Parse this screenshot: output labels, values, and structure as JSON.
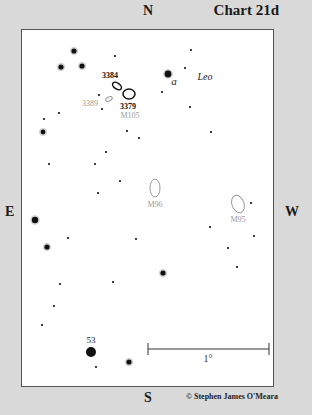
{
  "header": {
    "chart_title": "Chart 21d"
  },
  "compass": {
    "north": "N",
    "south": "S",
    "east": "E",
    "west": "W"
  },
  "constellation": {
    "label": "Leo",
    "x": 205,
    "y": 80
  },
  "scale_bar": {
    "label": "1°",
    "x1": 148,
    "x2": 269,
    "y": 349,
    "label_x": 208,
    "label_y": 362
  },
  "credit": "© Stephen James O'Meara",
  "colors": {
    "star": "#111111",
    "galaxy_primary": "#111111",
    "galaxy_secondary": "#9a9a9a",
    "frame_bg": "#ffffff",
    "page_bg": "#d9d9d9"
  },
  "galaxies": [
    {
      "id": "NGC 3384",
      "label": "3384",
      "x": 117,
      "y": 86,
      "rx": 5,
      "ry": 3,
      "angle": 35,
      "style": "primary",
      "label_x": 110,
      "label_y": 78
    },
    {
      "id": "NGC 3379",
      "label": "3379",
      "x": 129,
      "y": 94,
      "rx": 6,
      "ry": 5,
      "angle": 0,
      "style": "primary",
      "label_x": 128,
      "label_y": 109
    },
    {
      "id": "NGC 3389",
      "label": "3389",
      "x": 109,
      "y": 99,
      "rx": 3.5,
      "ry": 2,
      "angle": -25,
      "style": "secondary",
      "label_x": 90,
      "label_y": 106
    },
    {
      "id": "M105",
      "label": "M105",
      "x": 129,
      "y": 94,
      "rx": 0,
      "ry": 0,
      "angle": 0,
      "style": "label-only",
      "label_x": 130,
      "label_y": 118
    },
    {
      "id": "M96",
      "label": "M96",
      "x": 155,
      "y": 188,
      "rx": 5,
      "ry": 9,
      "angle": 0,
      "style": "secondary",
      "label_x": 155,
      "label_y": 207
    },
    {
      "id": "M95",
      "label": "M95",
      "x": 238,
      "y": 204,
      "rx": 6,
      "ry": 9,
      "angle": -20,
      "style": "secondary",
      "label_x": 238,
      "label_y": 222
    }
  ],
  "stars": [
    {
      "x": 74,
      "y": 51,
      "r": 2.6,
      "halo": true
    },
    {
      "x": 115,
      "y": 56,
      "r": 1.1
    },
    {
      "x": 191,
      "y": 50,
      "r": 1.1
    },
    {
      "x": 61,
      "y": 67,
      "r": 2.6,
      "halo": true
    },
    {
      "x": 82,
      "y": 66,
      "r": 2.6,
      "halo": true
    },
    {
      "x": 168,
      "y": 74,
      "r": 3.4,
      "halo": true,
      "label": "a",
      "label_x": 174,
      "label_y": 85
    },
    {
      "x": 185,
      "y": 68,
      "r": 1.1
    },
    {
      "x": 99,
      "y": 95,
      "r": 1.1
    },
    {
      "x": 102,
      "y": 109,
      "r": 1.1
    },
    {
      "x": 162,
      "y": 92,
      "r": 1.1
    },
    {
      "x": 59,
      "y": 113,
      "r": 1.1
    },
    {
      "x": 44,
      "y": 119,
      "r": 1.1
    },
    {
      "x": 43,
      "y": 132,
      "r": 2.4,
      "halo": true
    },
    {
      "x": 127,
      "y": 131,
      "r": 1.1
    },
    {
      "x": 139,
      "y": 138,
      "r": 1.1
    },
    {
      "x": 190,
      "y": 107,
      "r": 1.1
    },
    {
      "x": 211,
      "y": 132,
      "r": 1.1
    },
    {
      "x": 106,
      "y": 152,
      "r": 1.1
    },
    {
      "x": 95,
      "y": 164,
      "r": 1.1
    },
    {
      "x": 49,
      "y": 164,
      "r": 1.1
    },
    {
      "x": 120,
      "y": 181,
      "r": 1.1
    },
    {
      "x": 98,
      "y": 193,
      "r": 1.1
    },
    {
      "x": 35,
      "y": 220,
      "r": 3.2,
      "halo": true
    },
    {
      "x": 251,
      "y": 203,
      "r": 1.1
    },
    {
      "x": 210,
      "y": 227,
      "r": 1.1
    },
    {
      "x": 254,
      "y": 236,
      "r": 1.1
    },
    {
      "x": 228,
      "y": 248,
      "r": 1.1
    },
    {
      "x": 47,
      "y": 247,
      "r": 2.6,
      "halo": true
    },
    {
      "x": 68,
      "y": 238,
      "r": 1.1
    },
    {
      "x": 136,
      "y": 239,
      "r": 1.1
    },
    {
      "x": 237,
      "y": 267,
      "r": 1.1
    },
    {
      "x": 163,
      "y": 273,
      "r": 2.6,
      "halo": true
    },
    {
      "x": 60,
      "y": 284,
      "r": 1.1
    },
    {
      "x": 113,
      "y": 282,
      "r": 1.1
    },
    {
      "x": 54,
      "y": 306,
      "r": 1.1
    },
    {
      "x": 42,
      "y": 325,
      "r": 1.1
    },
    {
      "x": 91,
      "y": 352,
      "r": 5,
      "halo": false,
      "label": "53",
      "label_x": 91,
      "label_y": 343
    },
    {
      "x": 96,
      "y": 367,
      "r": 1.1
    },
    {
      "x": 129,
      "y": 362,
      "r": 2.6,
      "halo": true
    }
  ]
}
